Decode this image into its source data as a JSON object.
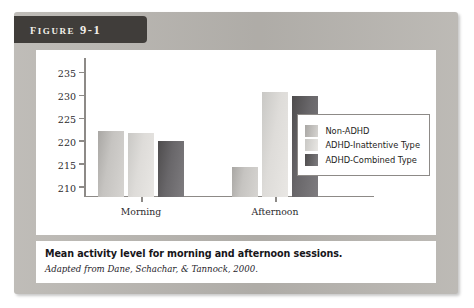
{
  "figure": {
    "tab_label": "Figure 9-1",
    "caption_main": "Mean activity level for morning and afternoon sessions.",
    "caption_source": "Adapted from Dane, Schachar, & Tannock, 2000."
  },
  "chart_data": {
    "type": "bar",
    "title": "",
    "xlabel": "",
    "ylabel": "",
    "categories": [
      "Morning",
      "Afternoon"
    ],
    "series": [
      {
        "name": "Non-ADHD",
        "color": "#c6c4c1",
        "values": [
          222.5,
          214.6
        ]
      },
      {
        "name": "ADHD-Inattentive Type",
        "color": "#dedcd9",
        "values": [
          222.0,
          231.0
        ]
      },
      {
        "name": "ADHD-Combined Type",
        "color": "#69676a",
        "values": [
          220.3,
          230.0
        ]
      }
    ],
    "ylim": [
      208,
      237
    ],
    "yticks": [
      210,
      215,
      220,
      225,
      230,
      235
    ],
    "ytick_labels": [
      "210",
      "215",
      "220",
      "225",
      "230",
      "235"
    ],
    "grid": false,
    "legend_position": "right"
  }
}
